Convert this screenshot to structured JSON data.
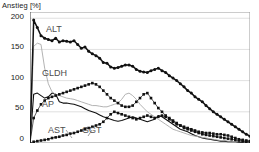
{
  "chart_data": {
    "type": "line",
    "title": "",
    "subtitle": "",
    "xlabel": "",
    "ylabel": "Anstieg [%]",
    "ylim": [
      0,
      210
    ],
    "xlim": [
      0,
      60
    ],
    "grid": true,
    "legend_position": "inline-labels",
    "yticks": [
      0,
      50,
      100,
      150,
      200
    ],
    "ytick_labels": [
      "0",
      "50",
      "100",
      "150",
      "200"
    ],
    "xticks": [],
    "xtick_labels": [],
    "x": [
      0,
      1,
      2,
      3,
      4,
      5,
      6,
      7,
      8,
      9,
      10,
      11,
      12,
      13,
      14,
      15,
      16,
      17,
      18,
      19,
      20,
      21,
      22,
      23,
      24,
      25,
      26,
      27,
      28,
      29,
      30,
      31,
      32,
      33,
      34,
      35,
      36,
      37,
      38,
      39,
      40,
      41,
      42,
      43,
      44,
      45,
      46,
      47,
      48,
      49,
      50,
      51,
      52,
      53,
      54,
      55,
      56,
      57,
      58,
      59,
      60
    ],
    "series": [
      {
        "name": "ALT",
        "color": "#111111",
        "style": "solid-thick-markers",
        "values": [
          0,
          197,
          185,
          172,
          168,
          166,
          164,
          168,
          162,
          164,
          163,
          162,
          164,
          158,
          152,
          154,
          147,
          143,
          140,
          136,
          129,
          128,
          122,
          120,
          121,
          123,
          125,
          125,
          123,
          118,
          115,
          114,
          113,
          116,
          118,
          120,
          116,
          113,
          108,
          104,
          100,
          95,
          90,
          84,
          80,
          74,
          70,
          66,
          60,
          55,
          50,
          46,
          42,
          38,
          34,
          30,
          26,
          22,
          18,
          14,
          11
        ]
      },
      {
        "name": "GLDH",
        "color": "#aaaaaa",
        "style": "thin-gray",
        "values": [
          0,
          155,
          160,
          158,
          120,
          95,
          82,
          78,
          76,
          74,
          72,
          71,
          70,
          68,
          66,
          64,
          62,
          60,
          60,
          59,
          58,
          58,
          60,
          62,
          64,
          70,
          78,
          80,
          76,
          70,
          62,
          56,
          50,
          46,
          42,
          38,
          34,
          30,
          26,
          22,
          20,
          18,
          16,
          14,
          12,
          11,
          10,
          9,
          8,
          7,
          6,
          5,
          4,
          4,
          3,
          3,
          2,
          2,
          2,
          1,
          1
        ]
      },
      {
        "name": "AP",
        "color": "#111111",
        "style": "solid-thin",
        "values": [
          0,
          78,
          80,
          76,
          72,
          74,
          80,
          78,
          66,
          64,
          64,
          63,
          62,
          60,
          58,
          55,
          52,
          50,
          48,
          45,
          42,
          40,
          38,
          36,
          35,
          36,
          38,
          40,
          42,
          40,
          38,
          36,
          34,
          36,
          38,
          44,
          42,
          38,
          34,
          30,
          26,
          22,
          20,
          18,
          15,
          12,
          10,
          8,
          7,
          6,
          5,
          4,
          3,
          3,
          2,
          2,
          2,
          1,
          1,
          1,
          0
        ]
      },
      {
        "name": "AST",
        "color": "#111111",
        "style": "dotted-markers",
        "values": [
          0,
          40,
          52,
          62,
          68,
          72,
          74,
          76,
          78,
          80,
          82,
          84,
          86,
          88,
          90,
          92,
          94,
          96,
          94,
          90,
          84,
          78,
          72,
          68,
          64,
          60,
          58,
          58,
          60,
          66,
          72,
          78,
          80,
          72,
          64,
          56,
          50,
          44,
          40,
          36,
          32,
          28,
          24,
          22,
          20,
          18,
          16,
          14,
          13,
          12,
          11,
          10,
          9,
          8,
          7,
          6,
          5,
          4,
          3,
          2,
          2
        ]
      },
      {
        "name": "GGT",
        "color": "#111111",
        "style": "dotted-markers",
        "values": [
          0,
          2,
          3,
          4,
          5,
          6,
          8,
          9,
          10,
          12,
          13,
          15,
          16,
          18,
          20,
          22,
          24,
          26,
          28,
          30,
          34,
          40,
          46,
          50,
          48,
          46,
          44,
          42,
          40,
          38,
          40,
          42,
          44,
          42,
          40,
          42,
          44,
          42,
          38,
          34,
          30,
          28,
          26,
          24,
          22,
          20,
          18,
          17,
          16,
          16,
          15,
          14,
          14,
          13,
          12,
          10,
          8,
          6,
          5,
          4,
          3
        ]
      }
    ],
    "annotations": [
      {
        "text": "ALT",
        "x_px": 46,
        "y_px": 24
      },
      {
        "text": "GLDH",
        "x_px": 42,
        "y_px": 68
      },
      {
        "text": "AP",
        "x_px": 42,
        "y_px": 99
      },
      {
        "text": "AST",
        "x_px": 48,
        "y_px": 125
      },
      {
        "text": "GGT",
        "x_px": 82,
        "y_px": 125
      }
    ]
  }
}
